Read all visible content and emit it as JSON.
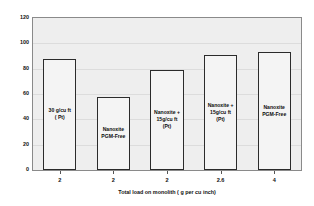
{
  "chart_data": {
    "type": "bar",
    "title": "",
    "xlabel": "Total load on monolith ( g per cu inch)",
    "ylabel": "% CO Conversion at 350 (C)",
    "categories": [
      "2",
      "2",
      "2",
      "2.6",
      "4"
    ],
    "values": [
      88,
      58,
      79,
      91,
      93
    ],
    "bar_labels": [
      "30 g/cu ft\n( Pt)",
      "Nanoxite\nPGM-Free",
      "Nanoxite +\n15g/cu ft\n(Pt)",
      "Nanoxite +\n15g/cu ft\n(Pt)",
      "Nanoxite\nPGM-Free"
    ],
    "ylim": [
      0,
      120
    ],
    "yticks": [
      0,
      20,
      40,
      60,
      80,
      100,
      120
    ],
    "ytick_labels": [
      "0",
      "20",
      "40",
      "60",
      "80",
      "100",
      "120"
    ],
    "grid": true,
    "legend": "none",
    "colors": {
      "plot_background": "#eeeeee",
      "bar_fill": "#f4f4f4",
      "bar_border": "#2b2b2b",
      "axis": "#8a8a8a",
      "gridline": "#dcdcdc",
      "text": "#111111"
    }
  }
}
